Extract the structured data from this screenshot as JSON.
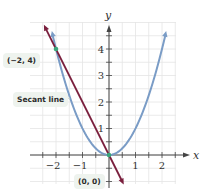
{
  "chart_data": {
    "type": "line",
    "title": "",
    "xlabel": "x",
    "ylabel": "y",
    "xlim": [
      -2.75,
      2.75
    ],
    "ylim": [
      -1,
      5
    ],
    "grid": true,
    "x_ticks": [
      -2,
      -1,
      1,
      2
    ],
    "y_ticks": [
      1,
      2,
      3,
      4
    ],
    "series": [
      {
        "name": "y = x^2 (parabola)",
        "color": "#7a9cc6",
        "function": "x^2",
        "x": [
          -2.2,
          -2,
          -1,
          0,
          1,
          2,
          2.2
        ],
        "y": [
          4.84,
          4,
          1,
          0,
          1,
          4,
          4.84
        ]
      },
      {
        "name": "Secant line",
        "color": "#7a1f3d",
        "function": "-2x",
        "x": [
          -2.4,
          0.5
        ],
        "y": [
          4.8,
          -1
        ]
      }
    ],
    "points": [
      {
        "label": "(-2, 4)",
        "x": -2,
        "y": 4,
        "color": "#3aa57a"
      },
      {
        "label": "(0, 0)",
        "x": 0,
        "y": 0,
        "color": "#3aa57a"
      }
    ],
    "annotations": [
      {
        "text": "(−2, 4)",
        "target": [
          -2,
          4
        ]
      },
      {
        "text": "Secant line",
        "target": "secant"
      },
      {
        "text": "(0, 0)",
        "target": [
          0,
          0
        ]
      }
    ]
  },
  "labels": {
    "x_axis": "x",
    "y_axis": "y",
    "x_ticks": [
      "−2",
      "−1",
      "1",
      "2"
    ],
    "y_ticks": [
      "1",
      "2",
      "3",
      "4"
    ],
    "point_a": "(−2, 4)",
    "secant": "Secant line",
    "point_b": "(0, 0)"
  },
  "colors": {
    "parabola": "#7a9cc6",
    "secant": "#7a1f3d",
    "point": "#3aa57a",
    "grid": "#e4e4e4",
    "axis": "#444444"
  }
}
